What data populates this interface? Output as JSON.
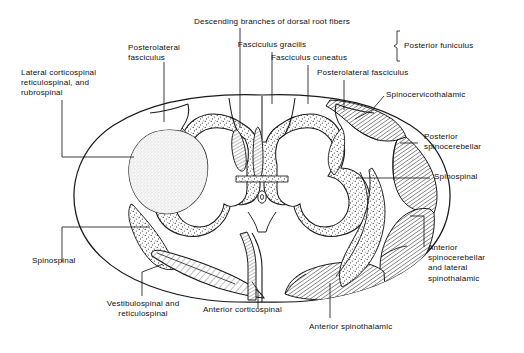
{
  "figure": {
    "type": "anatomical-cross-section",
    "colors": {
      "ink": "#1a1a1a",
      "background": "#ffffff",
      "gray_fill": "#d4d4d4",
      "hatch_dark": "#8f8f8f",
      "stipple": "#555555"
    }
  },
  "labels": {
    "lateral_corticospinal": "Lateral corticospinal\nreticulospinal, and\nrubrospinal",
    "posterolateral_fasciculus_left": "Posterolateral\nfasciculus",
    "descending_branches": "Descending branches of dorsal root fibers",
    "fasciculus_gracilis": "Fasciculus gracilis",
    "fasciculus_cuneatus": "Fasciculus cuneatus",
    "posterior_funiculus": "Posterior funiculus",
    "posterolateral_fasciculus_right": "Posterolateral fasciculus",
    "spinocervicothalamic": "Spinocervicothalamic",
    "posterior_spinocerebellar": "Posterior\nspinocerebellar",
    "spinospinal_right": "Spinospinal",
    "anterior_spinocerebellar": "Anterior\nspinocerebellar\nand lateral\nspinothalamic",
    "spinospinal_left": "Spinospinal",
    "vestibulospinal": "Vestibulospinal and\nreticulospinal",
    "anterior_corticospinal": "Anterior corticospinal",
    "anterior_spinothalamic": "Anterior spinothalamic"
  }
}
